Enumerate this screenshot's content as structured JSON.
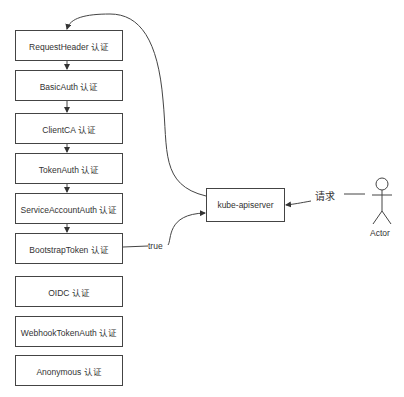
{
  "diagram": {
    "auth_chain": [
      {
        "label": "RequestHeader 认证",
        "y": 30
      },
      {
        "label": "BasicAuth 认证",
        "y": 70
      },
      {
        "label": "ClientCA 认证",
        "y": 113
      },
      {
        "label": "TokenAuth 认证",
        "y": 153
      },
      {
        "label": "ServiceAccountAuth 认证",
        "y": 193
      },
      {
        "label": "BootstrapToken 认证",
        "y": 233
      },
      {
        "label": "OIDC 认证",
        "y": 276
      },
      {
        "label": "WebhookTokenAuth 认证",
        "y": 316
      },
      {
        "label": "Anonymous 认证",
        "y": 355
      }
    ],
    "server": {
      "label": "kube-apiserver"
    },
    "actor": {
      "label": "Actor"
    },
    "edges": {
      "request_label": "请求",
      "true_label": "true"
    },
    "colors": {
      "stroke": "#444444",
      "text": "#333333",
      "background": "#ffffff"
    }
  }
}
